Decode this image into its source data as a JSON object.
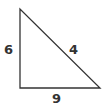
{
  "diagram": {
    "type": "right-triangle",
    "stroke_color": "#333333",
    "vertices": [
      [
        20,
        9
      ],
      [
        20,
        88
      ],
      [
        100,
        88
      ]
    ],
    "labels": {
      "left_side": "6",
      "hypotenuse": "4",
      "bottom_side": "9"
    }
  }
}
